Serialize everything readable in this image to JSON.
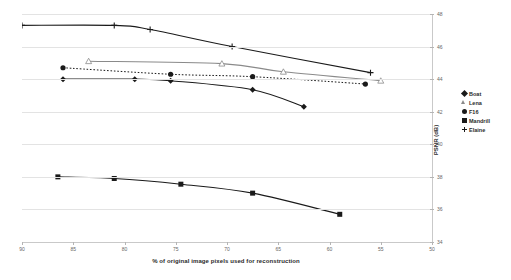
{
  "chart_data": {
    "type": "line",
    "title": "",
    "xlabel": "% of original image pixels used for reconstruction",
    "ylabel": "PSNR (dB)",
    "xlim": [
      90,
      50
    ],
    "ylim": [
      34,
      48
    ],
    "x_ticks": [
      90,
      85,
      80,
      75,
      70,
      65,
      60,
      55,
      50
    ],
    "y_ticks": [
      34,
      36,
      38,
      40,
      42,
      44,
      46,
      48
    ],
    "x_reversed": true,
    "y_axis_position": "right",
    "grid": "horizontal",
    "legend_position": "right",
    "series": [
      {
        "name": "Boat",
        "marker": "diamond",
        "line": "solid",
        "color": "#1a1a1a",
        "x": [
          86.0,
          79.0,
          75.5,
          67.5,
          62.5
        ],
        "y": [
          44.0,
          44.0,
          43.9,
          43.35,
          42.3
        ]
      },
      {
        "name": "Lena",
        "marker": "triangle-open",
        "line": "solid",
        "color": "#8a8a8a",
        "x": [
          83.5,
          70.5,
          64.5,
          55.0
        ],
        "y": [
          45.1,
          44.95,
          44.45,
          43.9
        ]
      },
      {
        "name": "F16",
        "marker": "circle",
        "line": "dotted",
        "color": "#1a1a1a",
        "x": [
          86.0,
          75.5,
          67.5,
          56.5
        ],
        "y": [
          44.7,
          44.3,
          44.15,
          43.7
        ]
      },
      {
        "name": "Mandrill",
        "marker": "square",
        "line": "solid",
        "color": "#1a1a1a",
        "x": [
          86.5,
          81.0,
          74.5,
          67.5,
          59.0
        ],
        "y": [
          38.0,
          37.9,
          37.55,
          37.0,
          35.7
        ]
      },
      {
        "name": "Elaine",
        "marker": "plus",
        "line": "solid",
        "color": "#1a1a1a",
        "x": [
          90.0,
          81.0,
          77.5,
          69.5,
          56.0
        ],
        "y": [
          47.3,
          47.3,
          47.05,
          46.0,
          44.4
        ]
      }
    ]
  },
  "axes": {
    "x_title": "% of original image pixels used for reconstruction",
    "y_title": "PSNR (dB)",
    "x_tick_labels": [
      "90",
      "85",
      "80",
      "75",
      "70",
      "65",
      "60",
      "55",
      "50"
    ],
    "y_tick_labels": [
      "34",
      "36",
      "38",
      "40",
      "42",
      "44",
      "46",
      "48"
    ]
  },
  "legend": {
    "items": [
      {
        "label": "Boat",
        "marker": "diamond"
      },
      {
        "label": "Lena",
        "marker": "triangle-open"
      },
      {
        "label": "F16",
        "marker": "circle"
      },
      {
        "label": "Mandrill",
        "marker": "square"
      },
      {
        "label": "Elaine",
        "marker": "plus"
      }
    ]
  }
}
